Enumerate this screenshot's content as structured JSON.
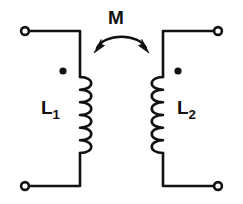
{
  "figure": {
    "kind": "circuit-schematic",
    "background_color": "#ffffff",
    "line_color": "#111111"
  },
  "labels": {
    "mutual_inductance": "M",
    "left_inductor": "L",
    "left_inductor_subscript": "1",
    "right_inductor": "L",
    "right_inductor_subscript": "2"
  },
  "components": {
    "left_coil": {
      "name": "L1",
      "bumps": 3,
      "bulge_direction": "right",
      "polarity_dot": "top-left"
    },
    "right_coil": {
      "name": "L2",
      "bumps": 3,
      "bulge_direction": "left",
      "polarity_dot": "top-right"
    },
    "coupling_arrow": {
      "name": "M",
      "style": "double-headed-curved-arrow",
      "direction": "bidirectional"
    }
  },
  "terminals": [
    {
      "name": "top-left-terminal",
      "style": "open-circle"
    },
    {
      "name": "bottom-left-terminal",
      "style": "open-circle"
    },
    {
      "name": "top-right-terminal",
      "style": "open-circle"
    },
    {
      "name": "bottom-right-terminal",
      "style": "open-circle"
    }
  ]
}
